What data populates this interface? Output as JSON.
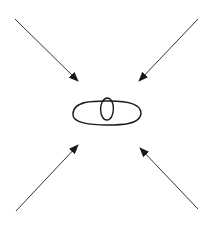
{
  "diagram": {
    "colors": {
      "background": "#ffffff",
      "stroke": "#1a1a1a",
      "arrow_line": "#333333"
    },
    "center_shape": {
      "ellipse": {
        "cx": 107,
        "cy": 113,
        "rx": 34,
        "ry": 12
      },
      "inner_loop": {
        "cx": 107,
        "cy": 109,
        "rx": 8,
        "ry": 11
      }
    },
    "arrows": [
      {
        "id": "top-left",
        "x1": 15,
        "y1": 19,
        "x2": 78,
        "y2": 81
      },
      {
        "id": "top-right",
        "x1": 198,
        "y1": 19,
        "x2": 139,
        "y2": 81
      },
      {
        "id": "bottom-left",
        "x1": 16,
        "y1": 211,
        "x2": 78,
        "y2": 145
      },
      {
        "id": "bottom-right",
        "x1": 198,
        "y1": 209,
        "x2": 140,
        "y2": 148
      }
    ]
  }
}
